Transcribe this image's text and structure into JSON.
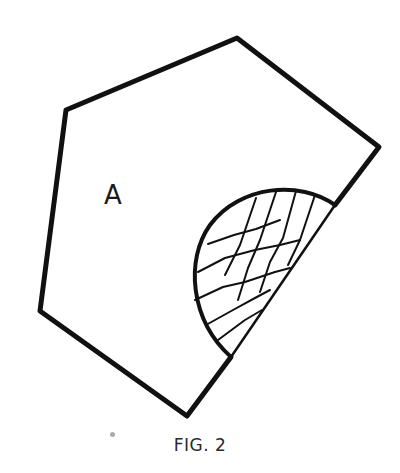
{
  "figure": {
    "caption": "FIG. 2",
    "region_label": "A",
    "stroke_color": "#111111"
  }
}
